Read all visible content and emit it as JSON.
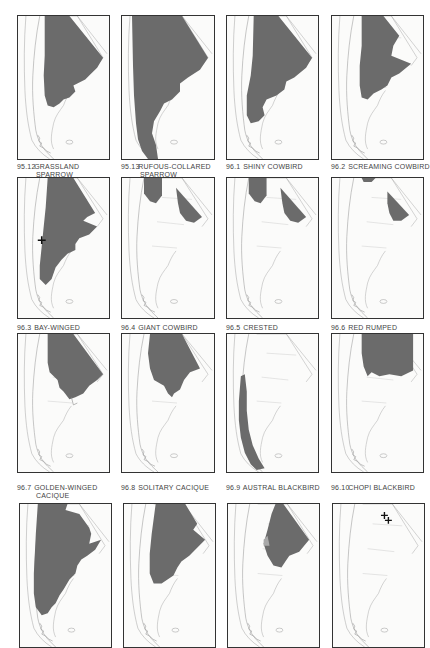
{
  "page": {
    "colors": {
      "range": "#6b6b6b",
      "outline": "#9a9a9a",
      "frame": "#333333",
      "pale_range": "#a8a8a8"
    }
  },
  "maps": [
    {
      "num": "95.12",
      "line1": "GRASSLAND",
      "line2": "SPARROW"
    },
    {
      "num": "95.13",
      "line1": "RUFOUS-COLLARED",
      "line2": "SPARROW"
    },
    {
      "num": "96.1",
      "line1": "SHINY COWBIRD",
      "line2": ""
    },
    {
      "num": "96.2",
      "line1": "SCREAMING COWBIRD",
      "line2": ""
    },
    {
      "num": "96.3",
      "line1": "BAY-WINGED",
      "line2": "COWBIRD"
    },
    {
      "num": "96.4",
      "line1": "GIANT COWBIRD",
      "line2": ""
    },
    {
      "num": "96.5",
      "line1": "CRESTED",
      "line2": "OROPENDOLA"
    },
    {
      "num": "96.6",
      "line1": "RED RUMPED",
      "line2": "CACIQUE"
    },
    {
      "num": "96.7",
      "line1": "GOLDEN-WINGED",
      "line2": "CACIQUE"
    },
    {
      "num": "96.8",
      "line1": "SOLITARY CACIQUE",
      "line2": ""
    },
    {
      "num": "96.9",
      "line1": "AUSTRAL BLACKBIRD",
      "line2": ""
    },
    {
      "num": "96.10",
      "line1": "CHOPI BLACKBIRD",
      "line2": ""
    },
    {
      "num": "",
      "line1": "",
      "line2": ""
    },
    {
      "num": "",
      "line1": "",
      "line2": ""
    },
    {
      "num": "",
      "line1": "",
      "line2": ""
    },
    {
      "num": "",
      "line1": "",
      "line2": ""
    }
  ]
}
